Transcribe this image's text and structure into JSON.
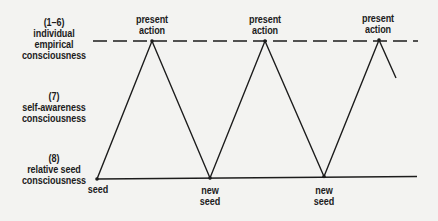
{
  "levels": [
    {
      "id": "empirical",
      "lines": [
        "(1–6)",
        "individual",
        "empirical",
        "consciousness"
      ]
    },
    {
      "id": "self",
      "lines": [
        "(7)",
        "self-awareness",
        "consciousness"
      ]
    },
    {
      "id": "seed",
      "lines": [
        "(8)",
        "relative seed",
        "consciousness"
      ]
    }
  ],
  "top_labels": [
    {
      "lines": [
        "present",
        "action"
      ]
    },
    {
      "lines": [
        "present",
        "action"
      ]
    },
    {
      "lines": [
        "present",
        "action"
      ]
    }
  ],
  "bottom_labels": [
    {
      "lines": [
        "seed"
      ]
    },
    {
      "lines": [
        "new",
        "seed"
      ]
    },
    {
      "lines": [
        "new",
        "seed"
      ]
    }
  ],
  "colors": {
    "ink": "#1c1c1c",
    "background": "#f3f3f1"
  }
}
